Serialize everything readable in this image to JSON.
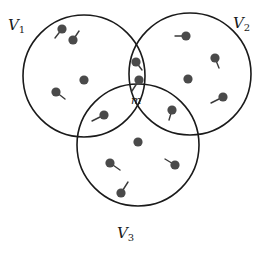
{
  "diagram": {
    "type": "venn-three-sets-with-nodes",
    "colors": {
      "stroke": "#1a1a1a",
      "node": "#4a4a4a"
    },
    "sets": [
      {
        "id": "V1",
        "label": "V",
        "subscript": "1",
        "cx": 84,
        "cy": 76,
        "r": 61,
        "label_x": 8,
        "label_y": 30
      },
      {
        "id": "V2",
        "label": "V",
        "subscript": "2",
        "cx": 190,
        "cy": 74,
        "r": 61,
        "label_x": 233,
        "label_y": 28
      },
      {
        "id": "V3",
        "label": "V",
        "subscript": "3",
        "cx": 138,
        "cy": 145,
        "r": 61,
        "label_x": 117,
        "label_y": 238
      }
    ],
    "center_node_label": {
      "text": "m",
      "x": 131,
      "y": 104
    },
    "nodes": [
      {
        "x": 62,
        "y": 29,
        "stick": [
          -7,
          9
        ]
      },
      {
        "x": 73,
        "y": 40,
        "stick": [
          6,
          -9
        ]
      },
      {
        "x": 84,
        "y": 80,
        "stick": null
      },
      {
        "x": 56,
        "y": 92,
        "stick": [
          9,
          7
        ]
      },
      {
        "x": 104,
        "y": 115,
        "stick": [
          -12,
          6
        ]
      },
      {
        "x": 186,
        "y": 36,
        "stick": [
          -11,
          0
        ]
      },
      {
        "x": 215,
        "y": 58,
        "stick": [
          4,
          10
        ]
      },
      {
        "x": 188,
        "y": 79,
        "stick": null
      },
      {
        "x": 223,
        "y": 97,
        "stick": [
          -12,
          6
        ]
      },
      {
        "x": 172,
        "y": 110,
        "stick": [
          -3,
          10
        ]
      },
      {
        "x": 136,
        "y": 62,
        "stick": [
          6,
          8
        ]
      },
      {
        "x": 139,
        "y": 80,
        "stick": [
          -7,
          11
        ]
      },
      {
        "x": 138,
        "y": 142,
        "stick": null
      },
      {
        "x": 110,
        "y": 163,
        "stick": [
          10,
          7
        ]
      },
      {
        "x": 175,
        "y": 165,
        "stick": [
          -10,
          -6
        ]
      },
      {
        "x": 121,
        "y": 193,
        "stick": [
          7,
          -11
        ]
      }
    ]
  }
}
